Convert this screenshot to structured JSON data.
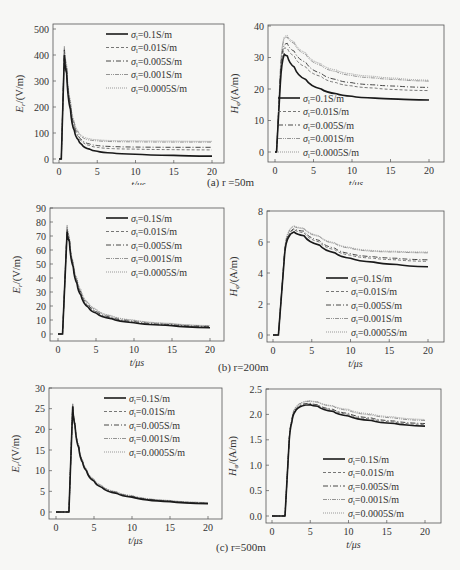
{
  "legend_labels": [
    "σ₁=0.1S/m",
    "σ₁=0.01S/m",
    "σ₁=0.005S/m",
    "σ₁=0.001S/m",
    "σ₁=0.0005S/m"
  ],
  "captions": {
    "a": "(a) r =50m",
    "b": "(b) r=200m",
    "c": "(c) r=500m"
  },
  "chart_data": [
    {
      "id": "a-E",
      "type": "line",
      "title": "",
      "xlabel": "t/μs",
      "ylabel": "E_r/(V/m)",
      "xlim": [
        0,
        20
      ],
      "ylim": [
        0,
        500
      ],
      "xticks": [
        0,
        5,
        10,
        15,
        20
      ],
      "yticks": [
        0,
        100,
        200,
        300,
        400,
        500
      ],
      "grid": false,
      "legend_position": "upper right",
      "x": [
        0,
        0.3,
        0.7,
        1.0,
        1.5,
        2,
        2.5,
        3,
        4,
        5,
        7,
        10,
        15,
        20
      ],
      "series": [
        {
          "name": "σ1=0.1S/m",
          "values": [
            0,
            0,
            400,
            330,
            190,
            110,
            75,
            55,
            38,
            30,
            23,
            18,
            14,
            11
          ]
        },
        {
          "name": "σ1=0.01S/m",
          "values": [
            0,
            0,
            415,
            345,
            205,
            125,
            88,
            68,
            52,
            45,
            40,
            38,
            36,
            35
          ]
        },
        {
          "name": "σ1=0.005S/m",
          "values": [
            0,
            0,
            420,
            350,
            210,
            130,
            93,
            73,
            58,
            52,
            48,
            46,
            45,
            45
          ]
        },
        {
          "name": "σ1=0.001S/m",
          "values": [
            0,
            0,
            430,
            360,
            220,
            140,
            103,
            85,
            73,
            70,
            67,
            66,
            65,
            65
          ]
        },
        {
          "name": "σ1=0.0005S/m",
          "values": [
            0,
            0,
            435,
            365,
            225,
            145,
            108,
            90,
            78,
            74,
            71,
            70,
            69,
            68
          ]
        }
      ]
    },
    {
      "id": "a-H",
      "type": "line",
      "title": "",
      "xlabel": "t/μs",
      "ylabel": "H_φ/(A/m)",
      "xlim": [
        0,
        20
      ],
      "ylim": [
        0,
        40
      ],
      "xticks": [
        0,
        5,
        10,
        15,
        20
      ],
      "yticks": [
        0,
        10,
        20,
        30,
        40
      ],
      "grid": false,
      "legend_position": "lower left",
      "x": [
        0,
        0.2,
        0.7,
        1.2,
        1.6,
        2.5,
        4,
        6,
        8,
        10,
        13,
        16,
        20
      ],
      "series": [
        {
          "name": "σ1=0.1S/m",
          "values": [
            0,
            0,
            22,
            31,
            30.5,
            27,
            23,
            20,
            18.5,
            17.7,
            17.1,
            16.8,
            16.5
          ]
        },
        {
          "name": "σ1=0.01S/m",
          "values": [
            0,
            0,
            24,
            33,
            33,
            30.5,
            27,
            24,
            22,
            21,
            20.3,
            19.8,
            19.5
          ]
        },
        {
          "name": "σ1=0.005S/m",
          "values": [
            0,
            0,
            25,
            34,
            34.5,
            32,
            28.5,
            25,
            23,
            22,
            21.3,
            20.9,
            20.5
          ]
        },
        {
          "name": "σ1=0.001S/m",
          "values": [
            0,
            0,
            26,
            36,
            36.5,
            34.5,
            31,
            27.5,
            25.5,
            24.3,
            23.5,
            23,
            22.5
          ]
        },
        {
          "name": "σ1=0.0005S/m",
          "values": [
            0,
            0,
            26.5,
            36.5,
            37,
            35,
            31.5,
            28,
            26,
            24.8,
            24,
            23.4,
            22.8
          ]
        }
      ]
    },
    {
      "id": "b-E",
      "type": "line",
      "title": "",
      "xlabel": "t/μs",
      "ylabel": "E_r/(V/m)",
      "xlim": [
        0,
        20
      ],
      "ylim": [
        0,
        90
      ],
      "xticks": [
        0,
        5,
        10,
        15,
        20
      ],
      "yticks": [
        0,
        10,
        20,
        30,
        40,
        50,
        60,
        70,
        80,
        90
      ],
      "grid": false,
      "legend_position": "upper right",
      "x": [
        0,
        0.6,
        1.2,
        1.5,
        2,
        2.5,
        3,
        4,
        5,
        7,
        10,
        15,
        20
      ],
      "series": [
        {
          "name": "σ1=0.1S/m",
          "values": [
            0,
            0,
            73,
            66,
            48,
            36,
            28,
            19,
            15,
            11,
            8,
            6,
            4.5
          ]
        },
        {
          "name": "σ1=0.01S/m",
          "values": [
            0,
            0,
            74,
            67,
            49,
            37,
            29,
            20,
            16,
            11.5,
            8.5,
            6.3,
            5
          ]
        },
        {
          "name": "σ1=0.005S/m",
          "values": [
            0,
            0,
            75,
            68,
            50,
            38,
            30,
            21,
            16.5,
            12,
            9,
            6.7,
            5.3
          ]
        },
        {
          "name": "σ1=0.001S/m",
          "values": [
            0,
            0,
            77,
            69,
            51,
            39,
            31,
            22,
            17.5,
            12.8,
            9.7,
            7.3,
            5.8
          ]
        },
        {
          "name": "σ1=0.0005S/m",
          "values": [
            0,
            0,
            78,
            70,
            52,
            40,
            32,
            22.5,
            18,
            13.2,
            10,
            7.6,
            6
          ]
        }
      ]
    },
    {
      "id": "b-H",
      "type": "line",
      "title": "",
      "xlabel": "t/μs",
      "ylabel": "H_φ/(A/m)",
      "xlim": [
        0,
        20
      ],
      "ylim": [
        0,
        8
      ],
      "xticks": [
        0,
        5,
        10,
        15,
        20
      ],
      "yticks": [
        0,
        2,
        4,
        6,
        8
      ],
      "grid": false,
      "legend_position": "lower right",
      "x": [
        0,
        0.7,
        1.5,
        2.0,
        2.7,
        4,
        6,
        8,
        10,
        13,
        16,
        20
      ],
      "series": [
        {
          "name": "σ1=0.1S/m",
          "values": [
            0,
            0,
            5.2,
            6.3,
            6.65,
            6.4,
            5.8,
            5.3,
            4.95,
            4.7,
            4.55,
            4.4
          ]
        },
        {
          "name": "σ1=0.01S/m",
          "values": [
            0,
            0,
            5.3,
            6.4,
            6.8,
            6.6,
            6.0,
            5.5,
            5.15,
            4.95,
            4.85,
            4.75
          ]
        },
        {
          "name": "σ1=0.005S/m",
          "values": [
            0,
            0,
            5.35,
            6.45,
            6.85,
            6.7,
            6.1,
            5.6,
            5.25,
            5.05,
            4.95,
            4.85
          ]
        },
        {
          "name": "σ1=0.001S/m",
          "values": [
            0,
            0,
            5.45,
            6.6,
            7.0,
            6.85,
            6.35,
            5.9,
            5.6,
            5.4,
            5.35,
            5.3
          ]
        },
        {
          "name": "σ1=0.0005S/m",
          "values": [
            0,
            0,
            5.5,
            6.65,
            7.05,
            6.9,
            6.4,
            5.95,
            5.65,
            5.45,
            5.4,
            5.35
          ]
        }
      ]
    },
    {
      "id": "c-E",
      "type": "line",
      "title": "",
      "xlabel": "t/μs",
      "ylabel": "E_r/(V/m)",
      "xlim": [
        0,
        20
      ],
      "ylim": [
        0,
        30
      ],
      "xticks": [
        0,
        5,
        10,
        15,
        20
      ],
      "yticks": [
        0,
        5,
        10,
        15,
        20,
        25,
        30
      ],
      "grid": false,
      "legend_position": "upper right",
      "x": [
        0,
        1.7,
        2.2,
        2.5,
        3,
        3.5,
        4,
        5,
        6,
        8,
        10,
        15,
        20
      ],
      "series": [
        {
          "name": "σ1=0.1S/m",
          "values": [
            0,
            0,
            25.5,
            21,
            15.5,
            12,
            10,
            7.5,
            6,
            4.5,
            3.6,
            2.5,
            2.0
          ]
        },
        {
          "name": "σ1=0.01S/m",
          "values": [
            0,
            0,
            25.7,
            21.2,
            15.7,
            12.2,
            10.1,
            7.6,
            6.1,
            4.6,
            3.7,
            2.6,
            2.1
          ]
        },
        {
          "name": "σ1=0.005S/m",
          "values": [
            0,
            0,
            25.8,
            21.3,
            15.8,
            12.3,
            10.2,
            7.7,
            6.2,
            4.7,
            3.8,
            2.65,
            2.15
          ]
        },
        {
          "name": "σ1=0.001S/m",
          "values": [
            0,
            0,
            26.1,
            21.5,
            16.0,
            12.5,
            10.4,
            7.9,
            6.4,
            4.85,
            3.9,
            2.75,
            2.25
          ]
        },
        {
          "name": "σ1=0.0005S/m",
          "values": [
            0,
            0,
            26.3,
            21.6,
            16.1,
            12.6,
            10.5,
            8.0,
            6.5,
            4.9,
            4.0,
            2.8,
            2.3
          ]
        }
      ]
    },
    {
      "id": "c-H",
      "type": "line",
      "title": "",
      "xlabel": "t/μs",
      "ylabel": "H_φ/(A/m)",
      "xlim": [
        0,
        20
      ],
      "ylim": [
        0,
        2.5
      ],
      "xticks": [
        0,
        5,
        10,
        15,
        20
      ],
      "yticks": [
        0.0,
        0.5,
        1.0,
        1.5,
        2.0,
        2.5
      ],
      "grid": false,
      "legend_position": "lower right",
      "x": [
        0,
        1.7,
        2.2,
        2.6,
        3,
        4,
        5,
        6,
        8,
        10,
        13,
        16,
        20
      ],
      "series": [
        {
          "name": "σ1=0.1S/m",
          "values": [
            0,
            0,
            1.35,
            1.85,
            2.05,
            2.17,
            2.19,
            2.16,
            2.06,
            1.97,
            1.88,
            1.82,
            1.77
          ]
        },
        {
          "name": "σ1=0.01S/m",
          "values": [
            0,
            0,
            1.36,
            1.87,
            2.07,
            2.19,
            2.21,
            2.18,
            2.09,
            2.0,
            1.91,
            1.85,
            1.8
          ]
        },
        {
          "name": "σ1=0.005S/m",
          "values": [
            0,
            0,
            1.37,
            1.88,
            2.08,
            2.2,
            2.22,
            2.19,
            2.1,
            2.02,
            1.93,
            1.87,
            1.82
          ]
        },
        {
          "name": "σ1=0.001S/m",
          "values": [
            0,
            0,
            1.38,
            1.9,
            2.11,
            2.23,
            2.26,
            2.24,
            2.16,
            2.08,
            1.99,
            1.93,
            1.88
          ]
        },
        {
          "name": "σ1=0.0005S/m",
          "values": [
            0,
            0,
            1.39,
            1.91,
            2.12,
            2.24,
            2.27,
            2.25,
            2.17,
            2.1,
            2.01,
            1.95,
            1.9
          ]
        }
      ]
    }
  ]
}
